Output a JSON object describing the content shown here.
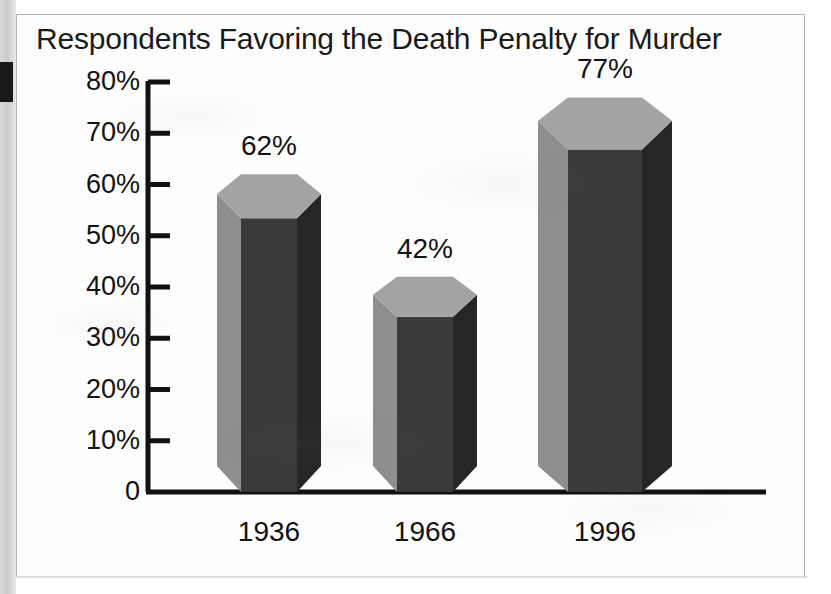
{
  "figure": {
    "title": "Respondents Favoring the Death Penalty for Murder",
    "background_color": "#ffffff",
    "frame_color": "#b4b4b4",
    "gutter_color": "#cdcdcd",
    "artifact_color": "#191919"
  },
  "chart_data": {
    "type": "bar",
    "title": "Respondents Favoring the Death Penalty for Murder",
    "xlabel": "",
    "ylabel": "",
    "categories": [
      "1936",
      "1966",
      "1996"
    ],
    "values": [
      62,
      42,
      77
    ],
    "value_labels": [
      "62%",
      "42%",
      "77%"
    ],
    "ylim": [
      0,
      80
    ],
    "ytick_values": [
      80,
      70,
      60,
      50,
      40,
      30,
      20,
      10,
      0
    ],
    "ytick_labels": [
      "80%",
      "70%",
      "60%",
      "50%",
      "40%",
      "30%",
      "20%",
      "10%",
      "0"
    ],
    "grid": false,
    "legend": null,
    "style": "3d-hexagonal-prism",
    "series": [
      {
        "name": "Respondents favoring the death penalty",
        "values": [
          62,
          42,
          77
        ]
      }
    ],
    "colors": {
      "bar_top": "#a3a3a3",
      "bar_left": "#8e8e8e",
      "bar_front": "#3a3a3a",
      "bar_right": "#262626",
      "axis": "#111111",
      "text": "#121212"
    }
  },
  "axis": {
    "ticks": [
      {
        "label": "80%",
        "value": 80
      },
      {
        "label": "70%",
        "value": 70
      },
      {
        "label": "60%",
        "value": 60
      },
      {
        "label": "50%",
        "value": 50
      },
      {
        "label": "40%",
        "value": 40
      },
      {
        "label": "30%",
        "value": 30
      },
      {
        "label": "20%",
        "value": 20
      },
      {
        "label": "10%",
        "value": 10
      },
      {
        "label": "0",
        "value": 0
      }
    ]
  },
  "bars": [
    {
      "category": "1936",
      "value": 62,
      "value_label": "62%"
    },
    {
      "category": "1966",
      "value": 42,
      "value_label": "42%"
    },
    {
      "category": "1996",
      "value": 77,
      "value_label": "77%"
    }
  ]
}
